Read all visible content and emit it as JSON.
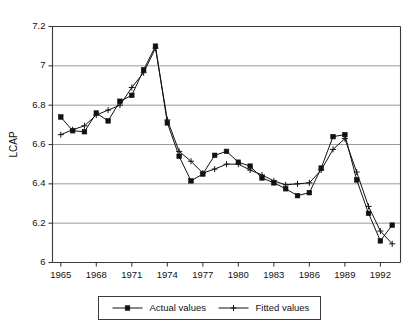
{
  "chart_data": {
    "type": "line",
    "title": "",
    "xlabel": "",
    "ylabel": "LCAP",
    "xlim": [
      1964.3,
      1993.7
    ],
    "ylim": [
      6.0,
      7.2
    ],
    "grid": true,
    "grid_axis": "y",
    "legend_position": "bottom-center",
    "y_ticks": [
      "6",
      "6.2",
      "6.4",
      "6.6",
      "6.8",
      "7",
      "7.2"
    ],
    "y_tick_values": [
      6.0,
      6.2,
      6.4,
      6.6,
      6.8,
      7.0,
      7.2
    ],
    "x_ticks": [
      "1965",
      "1968",
      "1971",
      "1974",
      "1977",
      "1980",
      "1983",
      "1986",
      "1989",
      "1992"
    ],
    "x_tick_values": [
      1965,
      1968,
      1971,
      1974,
      1977,
      1980,
      1983,
      1986,
      1989,
      1992
    ],
    "x": [
      1965,
      1966,
      1967,
      1968,
      1969,
      1970,
      1971,
      1972,
      1973,
      1974,
      1975,
      1976,
      1977,
      1978,
      1979,
      1980,
      1981,
      1982,
      1983,
      1984,
      1985,
      1986,
      1987,
      1988,
      1989,
      1990,
      1991,
      1992,
      1993
    ],
    "series": [
      {
        "name": "Actual values",
        "marker": "square",
        "values": [
          6.74,
          6.67,
          6.665,
          6.76,
          6.72,
          6.82,
          6.85,
          6.98,
          7.1,
          6.71,
          6.54,
          6.415,
          6.45,
          6.545,
          6.565,
          6.51,
          6.49,
          6.43,
          6.405,
          6.375,
          6.34,
          6.355,
          6.48,
          6.64,
          6.65,
          6.42,
          6.25,
          6.11,
          6.19
        ]
      },
      {
        "name": "Fitted values",
        "marker": "plus",
        "values": [
          6.65,
          6.675,
          6.695,
          6.75,
          6.775,
          6.8,
          6.89,
          6.965,
          7.09,
          6.725,
          6.565,
          6.515,
          6.455,
          6.475,
          6.5,
          6.5,
          6.47,
          6.445,
          6.415,
          6.395,
          6.4,
          6.405,
          6.47,
          6.575,
          6.63,
          6.46,
          6.285,
          6.16,
          6.095
        ]
      }
    ]
  },
  "legend": {
    "entries": [
      {
        "label": "Actual values"
      },
      {
        "label": "Fitted values"
      }
    ]
  }
}
